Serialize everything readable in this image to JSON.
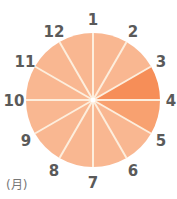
{
  "chart_data": {
    "type": "pie",
    "title": "",
    "unit_label": "(月)",
    "categories": [
      "1-2",
      "2-3",
      "3-4",
      "4-5",
      "5-6",
      "6-7",
      "7-8",
      "8-9",
      "9-10",
      "10-11",
      "11-12",
      "12-1"
    ],
    "boundary_labels": [
      "1",
      "2",
      "3",
      "4",
      "5",
      "6",
      "7",
      "8",
      "9",
      "10",
      "11",
      "12"
    ],
    "values": [
      1,
      1,
      1,
      1,
      1,
      1,
      1,
      1,
      1,
      1,
      1,
      1
    ],
    "highlight": {
      "3-4": "darkest",
      "4-5": "medium"
    },
    "colors": [
      "#f9b791",
      "#f9b791",
      "#f68e58",
      "#f8a170",
      "#f9b791",
      "#f9b791",
      "#f9b791",
      "#f9b791",
      "#f9b791",
      "#f9b791",
      "#f9b791",
      "#f9b791"
    ],
    "divider_color": "#fdeedd",
    "center": [
      93,
      100
    ],
    "radius": 67
  },
  "labels": [
    "1",
    "2",
    "3",
    "4",
    "5",
    "6",
    "7",
    "8",
    "9",
    "10",
    "11",
    "12"
  ],
  "unit": "(月)"
}
